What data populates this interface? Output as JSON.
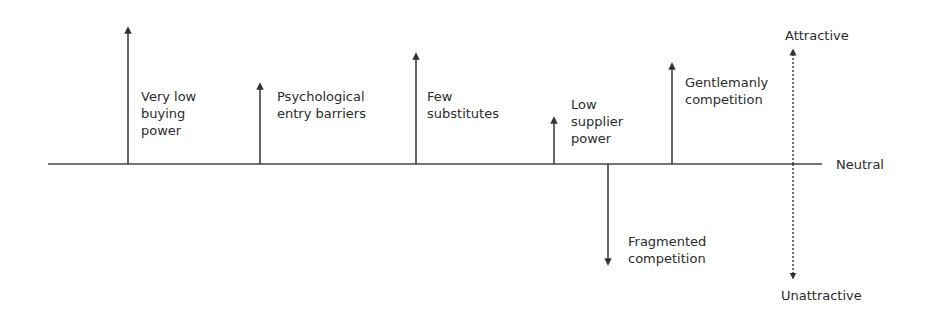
{
  "diagram": {
    "axis": {
      "neutral_label": "Neutral"
    },
    "scale": {
      "top_label": "Attractive",
      "bottom_label": "Unattractive"
    },
    "forces": [
      {
        "label": "Very low\nbuying\npower",
        "direction": "up",
        "x": 128,
        "tip_y": 28
      },
      {
        "label": "Psychological\nentry barriers",
        "direction": "up",
        "x": 260,
        "tip_y": 84
      },
      {
        "label": "Few\nsubstitutes",
        "direction": "up",
        "x": 416,
        "tip_y": 54
      },
      {
        "label": "Low\nsupplier\npower",
        "direction": "up",
        "x": 554,
        "tip_y": 118
      },
      {
        "label": "Gentlemanly\ncompetition",
        "direction": "up",
        "x": 672,
        "tip_y": 64
      },
      {
        "label": "Fragmented\ncompetition",
        "direction": "down",
        "x": 608,
        "tip_y": 264
      }
    ],
    "colors": {
      "line": "#333333",
      "text": "#2b2b2b"
    }
  }
}
